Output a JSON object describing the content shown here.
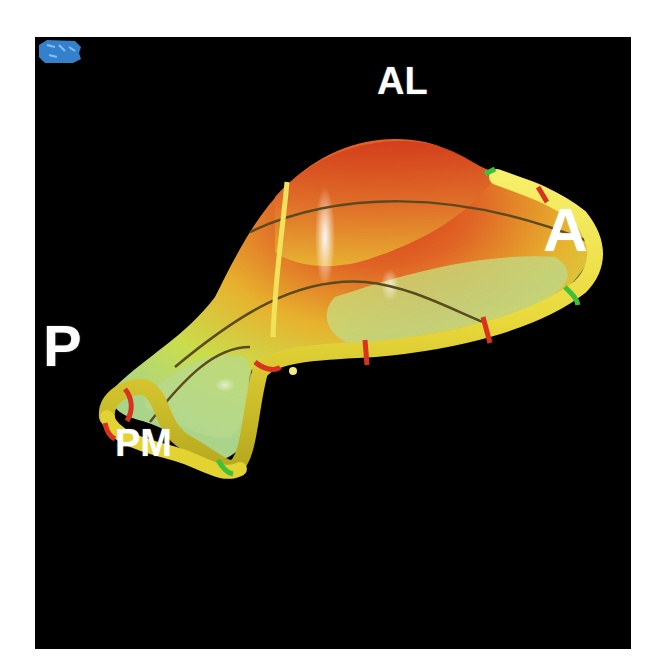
{
  "figure": {
    "labels": {
      "anterolateral": "AL",
      "anterior": "A",
      "posterior": "P",
      "posteromedial": "PM"
    },
    "colors": {
      "background": "#000000",
      "page": "#ffffff",
      "surface_high": "#d9401c",
      "surface_mid": "#e9a52a",
      "surface_low": "#c8e05a",
      "annulus_ring": "#f0e040",
      "marker_red": "#d8331f",
      "marker_green": "#3fbf3a",
      "grid_lines": "#5a4a20",
      "label_text": "#ffffff",
      "orientation_glyph": "#3b8ee0"
    },
    "orientation_icon": "orientation-cube-icon"
  }
}
